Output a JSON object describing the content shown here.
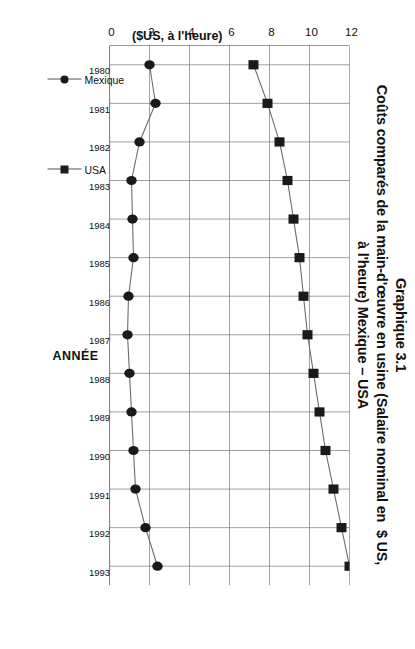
{
  "figure": {
    "title_line1": "Graphique 3.1",
    "title_line2": "Coûts comparés de la main-d'œuvre en usine (Salaire nominal en  $ US,",
    "title_line3": "à l'heure) Mexique – USA"
  },
  "axis": {
    "x_title": "ANNÉE",
    "y_title": "($US, à l'heure)"
  },
  "legend": {
    "items": [
      {
        "label": "Mexique",
        "marker": "circle",
        "color": "#1a1a1a"
      },
      {
        "label": "USA",
        "marker": "square",
        "color": "#1a1a1a"
      }
    ]
  },
  "chart_data": {
    "type": "line",
    "xlabel": "ANNÉE",
    "ylabel": "($US, à l'heure)",
    "x": [
      1980,
      1981,
      1982,
      1983,
      1984,
      1985,
      1986,
      1987,
      1988,
      1989,
      1990,
      1991,
      1992,
      1993
    ],
    "xticklabels": [
      "1980",
      "1981",
      "1982",
      "1983",
      "1984",
      "1985",
      "1986",
      "1987",
      "1988",
      "1989",
      "1990",
      "1991",
      "1992",
      "1993"
    ],
    "yticklabels": [
      "0",
      "2",
      "4",
      "6",
      "8",
      "10",
      "12"
    ],
    "yticks": [
      0,
      2,
      4,
      6,
      8,
      10,
      12
    ],
    "ylim": [
      0,
      12
    ],
    "grid": true,
    "legend_position": "bottom-right",
    "orientation": "rotated-90",
    "series": [
      {
        "name": "Mexique",
        "marker": "circle",
        "color": "#1a1a1a",
        "values": [
          2.0,
          2.3,
          1.5,
          1.1,
          1.15,
          1.2,
          0.95,
          0.9,
          1.0,
          1.1,
          1.2,
          1.3,
          1.8,
          2.4
        ]
      },
      {
        "name": "USA",
        "marker": "square",
        "color": "#1a1a1a",
        "values": [
          7.2,
          7.9,
          8.5,
          8.9,
          9.2,
          9.5,
          9.7,
          9.9,
          10.2,
          10.5,
          10.8,
          11.2,
          11.6,
          12.0
        ]
      }
    ]
  }
}
